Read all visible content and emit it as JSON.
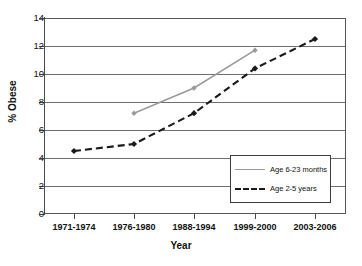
{
  "chart_data": {
    "type": "line",
    "title": "",
    "xlabel": "Year",
    "ylabel": "% Obese",
    "categories": [
      "1971-1974",
      "1976-1980",
      "1988-1994",
      "1999-2000",
      "2003-2006"
    ],
    "ylim": [
      0,
      14
    ],
    "yticks": [
      0,
      2,
      4,
      6,
      8,
      10,
      12,
      14
    ],
    "ytick_labels": [
      "0",
      "2",
      "4",
      "6",
      "8",
      "10",
      "12",
      "14"
    ],
    "grid": true,
    "legend_position": "center-right",
    "series": [
      {
        "name": "Age 6-23 months",
        "style": "solid",
        "color": "#9a9a9a",
        "marker": "diamond",
        "values": [
          null,
          7.2,
          9.0,
          11.7,
          null
        ]
      },
      {
        "name": "Age 2-5 years",
        "style": "dashed",
        "color": "#1a1a1a",
        "marker": "diamond",
        "values": [
          4.5,
          5.0,
          7.2,
          10.4,
          12.5
        ]
      }
    ]
  },
  "axes": {
    "y_title": "% Obese",
    "x_title": "Year",
    "y_tick_labels": [
      "14",
      "12",
      "10",
      "8",
      "6",
      "4",
      "2",
      "0"
    ],
    "x_tick_labels": [
      "1971-1974",
      "1976-1980",
      "1988-1994",
      "1999-2000",
      "2003-2006"
    ]
  },
  "legend": {
    "entries": [
      {
        "label": "Age 6-23 months",
        "style": "solid"
      },
      {
        "label": "Age 2-5 years",
        "style": "dashed"
      }
    ]
  },
  "colors": {
    "series_1": "#9a9a9a",
    "series_2": "#1a1a1a",
    "grid": "#6e6e6e",
    "axis": "#4a4a4a",
    "background": "#ffffff"
  }
}
